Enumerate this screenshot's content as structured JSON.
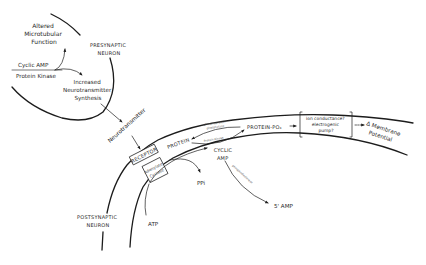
{
  "diagram": {
    "presynaptic": {
      "label_line1": "PRESYNAPTIC",
      "label_line2": "NEURON",
      "altered_line1": "Altered",
      "altered_line2": "Microtubular",
      "altered_line3": "Function",
      "cyclic_amp": "Cyclic AMP",
      "protein_kinase": "Protein Kinase",
      "increased_line1": "Increased",
      "increased_line2": "Neurotransmitter",
      "increased_line3": "Synthesis"
    },
    "neurotransmitter": "Neurotransmitter",
    "postsynaptic": {
      "label_line1": "POSTSYNAPTIC",
      "label_line2": "NEURON",
      "receptor": "RECEPTOR",
      "adenylate_line1": "Adenylate",
      "adenylate_line2": "Cyclase",
      "atp": "ATP",
      "ppi": "PPi",
      "protein": "PROTEIN",
      "protein_po4": "PROTEIN-PO₄",
      "phosphatase_line1": "phosphoprotein",
      "phosphatase_line2": "phosphatase",
      "protein_kinase": "Protein Kinase",
      "cyclic_line1": "CYCLIC",
      "cyclic_line2": "AMP",
      "phosphodiesterase": "phosphodiesterase",
      "five_amp": "5' AMP",
      "effect_line1": "ion conductance?",
      "effect_line2": "electrogenic",
      "effect_line3": "pump?",
      "membrane_line1": "Δ Membrane",
      "membrane_line2": "Potential"
    }
  }
}
